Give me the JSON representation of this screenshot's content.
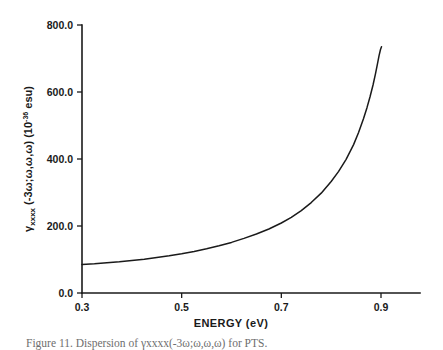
{
  "figure": {
    "caption": "Figure 11.  Dispersion of γxxxx(-3ω;ω,ω,ω) for PTS.",
    "background_color": "#ffffff",
    "ink_color": "#1a1a1a"
  },
  "chart_data": {
    "type": "line",
    "title": "",
    "xlabel": "ENERGY  (eV)",
    "ylabel": "γxxxx (-3ω;ω,ω,ω) (10-36 esu)",
    "ylabel_parts": {
      "gamma": "γ",
      "subscript": "xxxx",
      "args": " (-3ω;ω,ω,ω) (10",
      "exponent": "-36",
      "tail": " esu)"
    },
    "xlim": [
      0.3,
      0.94
    ],
    "ylim": [
      0.0,
      800.0
    ],
    "xticks": [
      0.3,
      0.5,
      0.7,
      0.9
    ],
    "xtick_labels": [
      "0.3",
      "0.5",
      "0.7",
      "0.9"
    ],
    "yticks": [
      0.0,
      200.0,
      400.0,
      600.0,
      800.0
    ],
    "ytick_labels": [
      "0.0",
      "200.0",
      "400.0",
      "600.0",
      "800.0"
    ],
    "grid": false,
    "legend": false,
    "series": [
      {
        "name": "gamma_xxxx dispersion",
        "color": "#1a1a1a",
        "x": [
          0.3,
          0.325,
          0.35,
          0.375,
          0.4,
          0.425,
          0.45,
          0.475,
          0.5,
          0.525,
          0.55,
          0.575,
          0.6,
          0.625,
          0.65,
          0.675,
          0.7,
          0.72,
          0.74,
          0.76,
          0.78,
          0.8,
          0.815,
          0.83,
          0.845,
          0.855,
          0.865,
          0.872,
          0.878,
          0.884,
          0.889,
          0.893,
          0.896,
          0.899,
          0.901
        ],
        "y": [
          85,
          87,
          90,
          93,
          97,
          101,
          106,
          111,
          117,
          124,
          132,
          141,
          151,
          163,
          176,
          191,
          209,
          226,
          246,
          270,
          298,
          333,
          363,
          399,
          443,
          479,
          521,
          554,
          586,
          621,
          655,
          685,
          708,
          727,
          735
        ]
      }
    ],
    "annotations": []
  },
  "axes_geometry": {
    "x_pixel_at_xmin": 82,
    "x_pixel_at_xmax": 381,
    "y_pixel_at_ymin": 293,
    "y_pixel_at_ymax": 25,
    "x_axis_right_end": 420
  }
}
